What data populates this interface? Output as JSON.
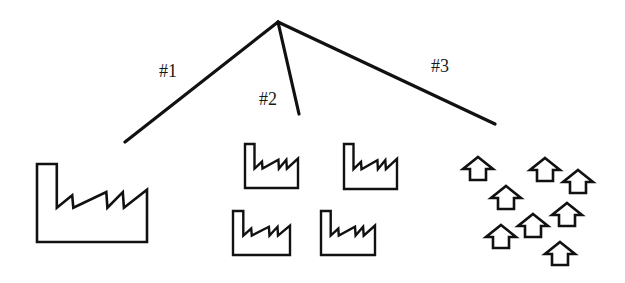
{
  "diagram": {
    "type": "tree",
    "root": {
      "x": 278,
      "y": 22
    },
    "stroke_color": "#111111",
    "branches": [
      {
        "id": "branch-1",
        "label": "#1",
        "end": {
          "x": 125,
          "y": 142
        },
        "label_pos": {
          "x": 159,
          "y": 62
        },
        "target": "one-large-factory"
      },
      {
        "id": "branch-2",
        "label": "#2",
        "end": {
          "x": 299,
          "y": 114
        },
        "label_pos": {
          "x": 259,
          "y": 90
        },
        "target": "four-small-factories"
      },
      {
        "id": "branch-3",
        "label": "#3",
        "end": {
          "x": 495,
          "y": 124
        },
        "label_pos": {
          "x": 431,
          "y": 57
        },
        "target": "eight-arrows"
      }
    ],
    "groups": [
      {
        "name": "one-large-factory",
        "icon": "factory-icon",
        "items": [
          {
            "x": 37,
            "y": 164,
            "w": 110,
            "h": 78
          }
        ]
      },
      {
        "name": "four-small-factories",
        "icon": "factory-icon",
        "items": [
          {
            "x": 245,
            "y": 144,
            "w": 53,
            "h": 44
          },
          {
            "x": 344,
            "y": 144,
            "w": 53,
            "h": 45
          },
          {
            "x": 233,
            "y": 211,
            "w": 57,
            "h": 44
          },
          {
            "x": 321,
            "y": 211,
            "w": 54,
            "h": 44
          }
        ]
      },
      {
        "name": "eight-arrows",
        "icon": "up-arrow-icon",
        "items": [
          {
            "tipX": 478,
            "tipY": 157
          },
          {
            "tipX": 545,
            "tipY": 158
          },
          {
            "tipX": 578,
            "tipY": 170
          },
          {
            "tipX": 506,
            "tipY": 186
          },
          {
            "tipX": 567,
            "tipY": 203
          },
          {
            "tipX": 533,
            "tipY": 214
          },
          {
            "tipX": 501,
            "tipY": 225
          },
          {
            "tipX": 560,
            "tipY": 242
          }
        ]
      }
    ]
  }
}
